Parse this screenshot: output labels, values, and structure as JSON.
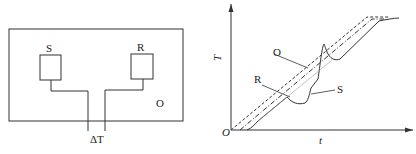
{
  "apparatus": {
    "furnace_label": "O",
    "sample_label": "S",
    "reference_label": "R",
    "delta_label": "ΔT"
  },
  "graph": {
    "y_axis_label": "T",
    "x_axis_label": "t",
    "origin_label": "O",
    "curves": [
      {
        "name": "O",
        "style": "dashed",
        "meaning": "furnace temperature"
      },
      {
        "name": "R",
        "style": "dash-dot",
        "meaning": "reference temperature"
      },
      {
        "name": "S",
        "style": "solid",
        "meaning": "sample temperature"
      }
    ],
    "callouts": {
      "O": "O",
      "R": "R",
      "S": "S"
    }
  },
  "colors": {
    "line": "#333333",
    "background": "#ffffff"
  }
}
